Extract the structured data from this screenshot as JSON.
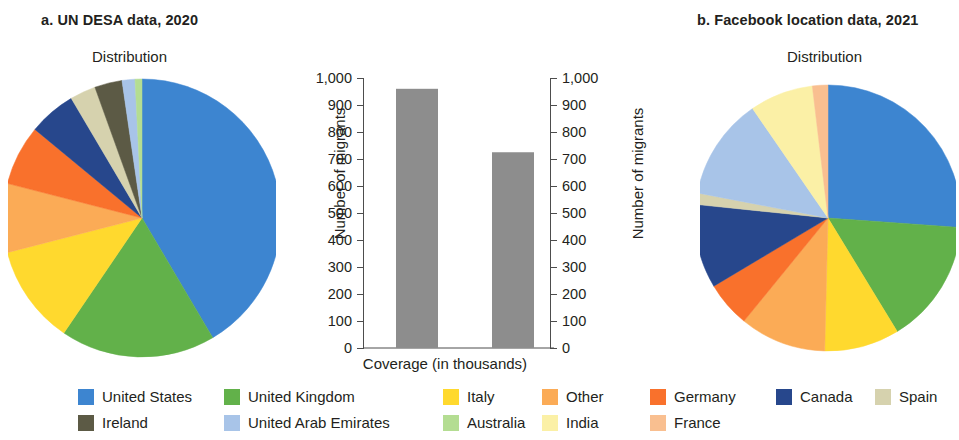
{
  "panels": {
    "a": {
      "title": "a. UN DESA data, 2020",
      "subtitle": "Distribution"
    },
    "b": {
      "title": "b. Facebook location data, 2021",
      "subtitle": "Distribution"
    }
  },
  "legend": {
    "items": [
      {
        "label": "United States",
        "color": "#3d85d0"
      },
      {
        "label": "United Kingdom",
        "color": "#62b martial"
      },
      {
        "label": "Italy",
        "color": "#ffd92e"
      },
      {
        "label": "Other",
        "color": "#fbab56"
      },
      {
        "label": "Germany",
        "color": "#f9712c"
      },
      {
        "label": "Canada",
        "color": "#27478c"
      },
      {
        "label": "Spain",
        "color": "#d6d2ae"
      },
      {
        "label": "Ireland",
        "color": "#5c5a45"
      },
      {
        "label": "United Arab Emirates",
        "color": "#a8c4e8"
      },
      {
        "label": "Australia",
        "color": "#b4dd92"
      },
      {
        "label": "India",
        "color": "#fbf0a6"
      },
      {
        "label": "France",
        "color": "#f9bf90"
      }
    ]
  },
  "chart_data": [
    {
      "type": "pie",
      "title": "a. UN DESA data, 2020",
      "subtitle": "Distribution",
      "panel": "a",
      "categories": [
        "United States",
        "United Kingdom",
        "Italy",
        "Other",
        "Germany",
        "Canada",
        "Spain",
        "Ireland",
        "United Arab Emirates",
        "Australia"
      ],
      "values": [
        41.5,
        18.0,
        11.5,
        8.0,
        7.0,
        5.5,
        3.0,
        3.2,
        1.5,
        0.8
      ],
      "unit": "percent",
      "colors": [
        "#3d85d0",
        "#62b14a",
        "#ffd92e",
        "#fbab56",
        "#f9712c",
        "#27478c",
        "#d6d2ae",
        "#5c5a45",
        "#a8c4e8",
        "#b4dd92"
      ],
      "legend": "bottom"
    },
    {
      "type": "bar",
      "title": "",
      "xlabel": "Coverage (in thousands)",
      "ylabel": "Number of migrants",
      "ylabel_right": "Number of migrants",
      "categories": [
        "UN DESA data, 2020",
        "Facebook location data, 2021"
      ],
      "values": [
        960,
        725
      ],
      "ylim": [
        0,
        1000
      ],
      "yticks": [
        0,
        100,
        200,
        300,
        400,
        500,
        600,
        700,
        800,
        900,
        1000
      ],
      "ytick_labels": [
        "0",
        "100",
        "200",
        "300",
        "400",
        "500",
        "600",
        "700",
        "800",
        "900",
        "1,000"
      ],
      "bar_color": "#8d8d8d",
      "grid": false
    },
    {
      "type": "pie",
      "title": "b. Facebook location data, 2021",
      "subtitle": "Distribution",
      "panel": "b",
      "categories": [
        "United States",
        "United Kingdom",
        "Italy",
        "Other",
        "Germany",
        "Canada",
        "Spain",
        "United Arab Emirates",
        "India",
        "France"
      ],
      "values": [
        26.4,
        15.3,
        9.2,
        10.6,
        5.6,
        10.3,
        1.4,
        12.5,
        7.8,
        1.9
      ],
      "unit": "percent",
      "colors": [
        "#3d85d0",
        "#62b14a",
        "#ffd92e",
        "#fbab56",
        "#f9712c",
        "#27478c",
        "#d6d2ae",
        "#a8c4e8",
        "#fbf0a6",
        "#f9bf90"
      ],
      "legend": "bottom"
    }
  ]
}
